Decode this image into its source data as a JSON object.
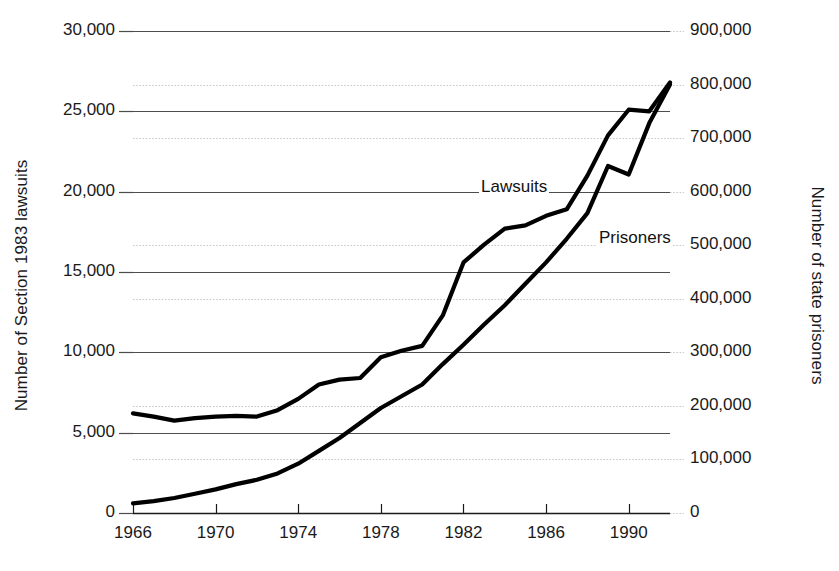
{
  "chart_data": {
    "type": "line",
    "title": "",
    "subtitle": "",
    "xlabel": "",
    "ylabel": "Number of Section 1983 lawsuits",
    "ylabel_right": "Number of state prisoners",
    "grid": true,
    "legend_position": "inline-annotations",
    "x": [
      1966,
      1967,
      1968,
      1969,
      1970,
      1971,
      1972,
      1973,
      1974,
      1975,
      1976,
      1977,
      1978,
      1979,
      1980,
      1981,
      1982,
      1983,
      1984,
      1985,
      1986,
      1987,
      1988,
      1989,
      1990,
      1991,
      1992
    ],
    "xlim": [
      1966,
      1992
    ],
    "xticks": [
      1966,
      1970,
      1974,
      1978,
      1982,
      1986,
      1990
    ],
    "xticklabels": [
      "1966",
      "1970",
      "1974",
      "1978",
      "1982",
      "1986",
      "1990"
    ],
    "ylim": [
      0,
      30000
    ],
    "yticks": [
      0,
      5000,
      10000,
      15000,
      20000,
      25000,
      30000
    ],
    "yticklabels": [
      "0",
      "5,000",
      "10,000",
      "15,000",
      "20,000",
      "25,000",
      "30,000"
    ],
    "ylim_right": [
      0,
      900000
    ],
    "yticks_right": [
      0,
      100000,
      200000,
      300000,
      400000,
      500000,
      600000,
      700000,
      800000,
      900000
    ],
    "yticklabels_right": [
      "0",
      "100,000",
      "200,000",
      "300,000",
      "400,000",
      "500,000",
      "600,000",
      "700,000",
      "800,000",
      "900,000"
    ],
    "series": [
      {
        "name": "Lawsuits",
        "axis": "left",
        "annotation": "Lawsuits",
        "values": [
          6200,
          6000,
          5750,
          5900,
          6000,
          6050,
          6000,
          6400,
          7100,
          8000,
          8300,
          8400,
          9700,
          10100,
          10400,
          12300,
          15600,
          16700,
          17700,
          17900,
          18500,
          18900,
          21000,
          23500,
          25100,
          25000,
          26800
        ]
      },
      {
        "name": "Prisoners",
        "axis": "right",
        "annotation": "Prisoners",
        "values": [
          18000,
          22000,
          28000,
          36000,
          44000,
          54000,
          62000,
          74000,
          92000,
          116000,
          140000,
          168000,
          196000,
          218000,
          240000,
          278000,
          314000,
          352000,
          388000,
          428000,
          468000,
          512000,
          560000,
          648000,
          632000,
          728000,
          800000
        ]
      }
    ]
  },
  "annotations": {
    "lawsuits_label": "Lawsuits",
    "prisoners_label": "Prisoners"
  },
  "colors": {
    "line": "#000000",
    "axis": "#1a1a1a",
    "grid_major": "#4d4d4d",
    "grid_minor": "#c8c8c8",
    "background": "#ffffff"
  }
}
